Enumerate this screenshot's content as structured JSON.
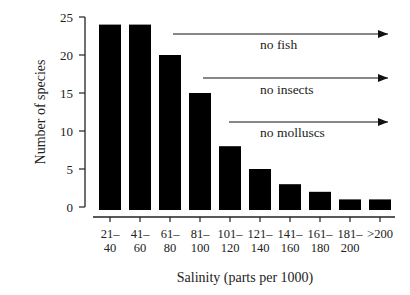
{
  "chart_data": {
    "type": "bar",
    "title": "",
    "xlabel": "Salinity (parts per 1000)",
    "ylabel": "Number of species",
    "categories": [
      "21–40",
      "41–60",
      "61–80",
      "81–100",
      "101–120",
      "121–140",
      "141–160",
      "161–180",
      "181–200",
      ">200"
    ],
    "category_lines": [
      [
        "21–",
        "40"
      ],
      [
        "41–",
        "60"
      ],
      [
        "61–",
        "80"
      ],
      [
        "81–",
        "100"
      ],
      [
        "101–",
        "120"
      ],
      [
        "121–",
        "140"
      ],
      [
        "141–",
        "160"
      ],
      [
        "161–",
        "180"
      ],
      [
        "181–",
        "200"
      ],
      [
        ">200",
        ""
      ]
    ],
    "values": [
      24,
      24,
      20,
      15,
      8,
      5,
      3,
      2,
      1,
      1
    ],
    "ylim": [
      0,
      25
    ],
    "yticks": [
      0,
      5,
      10,
      15,
      20,
      25
    ],
    "grid": false,
    "legend": null,
    "bar_color": "#000000",
    "annotations": [
      {
        "label": "no fish",
        "arrow_from_category_index": 2,
        "y_level": 23
      },
      {
        "label": "no insects",
        "arrow_from_category_index": 3,
        "y_level": 17
      },
      {
        "label": "no molluscs",
        "arrow_from_category_index": 4,
        "y_level": 11.5
      }
    ]
  }
}
